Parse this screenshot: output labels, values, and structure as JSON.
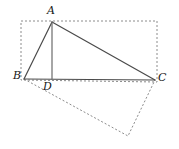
{
  "figure": {
    "kind": "geometry-diagram",
    "canvas": {
      "width": 179,
      "height": 149,
      "background": "#ffffff"
    },
    "colors": {
      "solid_stroke": "#4a4a4a",
      "dashed_stroke": "#8c8c8c",
      "label_text": "#161616"
    },
    "points": {
      "A": {
        "label": "A",
        "x": 52,
        "y": 22
      },
      "B": {
        "label": "B",
        "x": 24,
        "y": 79
      },
      "C": {
        "label": "C",
        "x": 155,
        "y": 80
      },
      "D": {
        "label": "D",
        "x": 52,
        "y": 79
      }
    },
    "solid_segments": [
      {
        "name": "segment-AB",
        "from": "A",
        "to": "B"
      },
      {
        "name": "segment-AC",
        "from": "A",
        "to": "C"
      },
      {
        "name": "segment-BC",
        "from": "B",
        "to": "C"
      },
      {
        "name": "segment-AD",
        "from": "A",
        "to": "D"
      }
    ],
    "dashed_rectangle": {
      "name": "dashed-rectangle",
      "vertices": [
        {
          "x": 21,
          "y": 21
        },
        {
          "x": 157,
          "y": 21
        },
        {
          "x": 157,
          "y": 82
        },
        {
          "x": 21,
          "y": 80
        }
      ]
    },
    "dashed_quadrilateral": {
      "name": "dashed-lower-quadrilateral",
      "vertices": [
        {
          "x": 24,
          "y": 79
        },
        {
          "x": 128,
          "y": 136
        },
        {
          "x": 155,
          "y": 80
        }
      ]
    }
  }
}
